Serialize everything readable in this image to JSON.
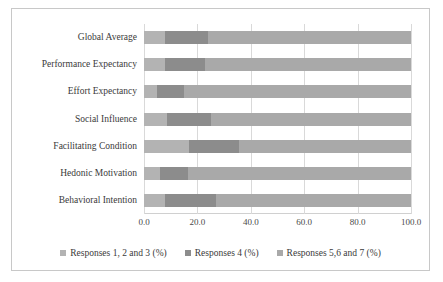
{
  "chart_data": {
    "type": "bar",
    "orientation": "horizontal",
    "stacked": true,
    "stack_mode": "percent",
    "title": "",
    "subtitle": "",
    "xlabel": "",
    "ylabel": "",
    "xlim": [
      0,
      100
    ],
    "xticks": [
      "0.0",
      "20.0",
      "40.0",
      "60.0",
      "80.0",
      "100.0"
    ],
    "xtick_values": [
      0,
      20,
      40,
      60,
      80,
      100
    ],
    "grid": true,
    "grid_axis": "x",
    "legend_position": "bottom",
    "categories": [
      "Global Average",
      "Performance Expectancy",
      "Effort Expectancy",
      "Social Influence",
      "Facilitating Condition",
      "Hedonic Motivation",
      "Behavioral Intention"
    ],
    "series": [
      {
        "name": "Responses 1, 2 and 3 (%)",
        "color": "#b3b3b3",
        "values": [
          8.0,
          8.0,
          5.0,
          8.5,
          17.0,
          6.0,
          8.0
        ]
      },
      {
        "name": "Responses 4 (%)",
        "color": "#8c8c8c",
        "values": [
          16.0,
          15.0,
          10.0,
          16.5,
          18.5,
          10.5,
          19.0
        ]
      },
      {
        "name": "Responses 5,6 and 7 (%)",
        "color": "#a9a9a9",
        "values": [
          76.0,
          77.0,
          85.0,
          75.0,
          64.5,
          83.5,
          73.0
        ]
      }
    ]
  },
  "legend": {
    "items": [
      {
        "label": "Responses 1, 2 and 3 (%)",
        "color": "#b3b3b3"
      },
      {
        "label": "Responses 4 (%)",
        "color": "#8c8c8c"
      },
      {
        "label": "Responses 5,6 and 7 (%)",
        "color": "#a9a9a9"
      }
    ]
  }
}
